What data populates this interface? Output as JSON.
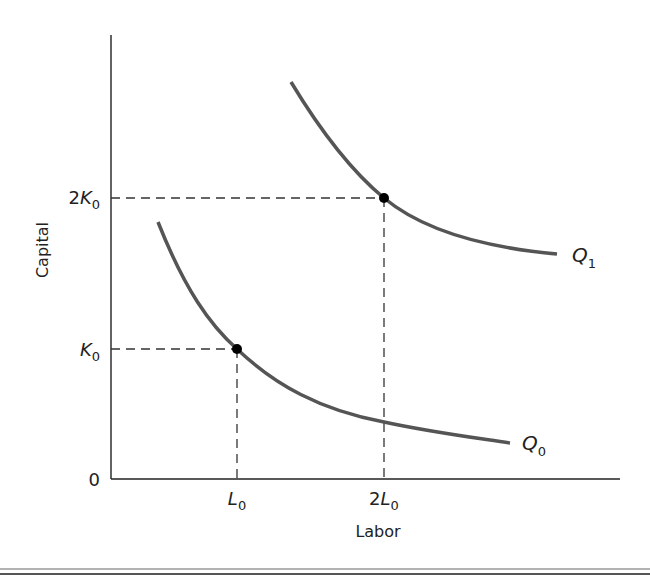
{
  "diagram": {
    "type": "isoquant",
    "x_axis_label": "Labor",
    "y_axis_label": "Capital",
    "origin_label": "0",
    "x_ticks": [
      {
        "prefix": "",
        "var": "L",
        "sub": "0"
      },
      {
        "prefix": "2",
        "var": "L",
        "sub": "0"
      }
    ],
    "y_ticks": [
      {
        "prefix": "",
        "var": "K",
        "sub": "0"
      },
      {
        "prefix": "2",
        "var": "K",
        "sub": "0"
      }
    ],
    "curves": [
      {
        "name": "Q",
        "sub": "0",
        "color": "#555555"
      },
      {
        "name": "Q",
        "sub": "1",
        "color": "#555555"
      }
    ],
    "points": [
      {
        "x": "L0",
        "y": "K0",
        "curve": "Q0"
      },
      {
        "x": "2L0",
        "y": "2K0",
        "curve": "Q1"
      }
    ],
    "colors": {
      "axis": "#222222",
      "curve": "#555555",
      "dash": "#333333",
      "point": "#000000"
    }
  }
}
